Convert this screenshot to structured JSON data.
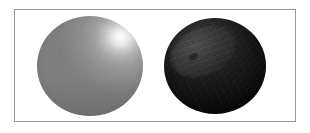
{
  "figure": {
    "caption": "",
    "background_color": "#ffffff",
    "panel": {
      "border_color": "#9a9a9a",
      "fill_color": "#ffffff",
      "x": 14,
      "y": 9,
      "width": 282,
      "height": 113
    }
  },
  "objects": [
    {
      "name": "sphere-light",
      "label": "",
      "position": "left",
      "shape": "sphere",
      "center_x": 90,
      "center_y": 69,
      "diameter": 106,
      "base_color": "#9d9d9d",
      "shadow_color": "#7f7f7f",
      "highlight_color": "#e8e8e8",
      "highlight_x_pct": 78,
      "highlight_y_pct": 21,
      "description": "Smooth mid-gray shaded sphere with a soft diffuse specular highlight in the upper-right quadrant"
    },
    {
      "name": "sphere-dark",
      "label": "",
      "position": "right",
      "shape": "sphere",
      "center_x": 215,
      "center_y": 69,
      "diameter": 102,
      "base_color": "#1f1f1f",
      "shadow_color": "#090909",
      "highlight_color": "#4d4d4d",
      "patch": {
        "name": "elliptical-region",
        "fill_color": "#424242",
        "rotation_deg": -24,
        "width_pct": 70,
        "height_pct": 52,
        "offset_x_pct": 4,
        "offset_y_pct": 8
      },
      "description": "Very dark shaded sphere with a tilted, slightly lighter elliptical region across the upper-left portion"
    }
  ],
  "accessibility": {
    "alt_text": "Two rendered spheres side by side inside a thin gray rectangular border: a light gray sphere with a bright highlight on the left and a near-black sphere with a lighter tilted elliptical patch on the right."
  }
}
